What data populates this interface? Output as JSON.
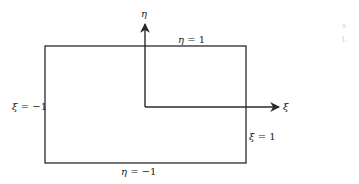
{
  "diagram": {
    "type": "reference-square-element",
    "colors": {
      "stroke": "#2a2a2a",
      "text": "#222222",
      "background": "#ffffff",
      "artifact": "#d0d0d0"
    },
    "rectangle": {
      "x": 45,
      "y": 46,
      "width": 201,
      "height": 117
    },
    "axes": {
      "origin": {
        "x": 145,
        "y": 107
      },
      "eta": {
        "label": "η",
        "tip": {
          "x": 145,
          "y": 23
        }
      },
      "xi": {
        "label": "ξ",
        "tip": {
          "x": 281,
          "y": 107
        }
      }
    },
    "edge_labels": {
      "top": {
        "var": "η",
        "eq": " = 1"
      },
      "bottom": {
        "var": "η",
        "eq": " = −1"
      },
      "left": {
        "var": "ξ",
        "eq": " = −1"
      },
      "right": {
        "var": "ξ",
        "eq": " = 1"
      }
    },
    "artifacts": [
      "x",
      "L"
    ]
  }
}
